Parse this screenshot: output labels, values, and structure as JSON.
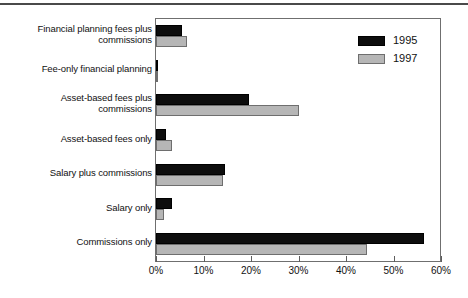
{
  "chart_data": {
    "type": "bar",
    "orientation": "horizontal",
    "title": "",
    "xlabel": "",
    "ylabel": "",
    "xlim": [
      0,
      60
    ],
    "grid": false,
    "legend_position": "top-right",
    "xtick_labels": [
      "0%",
      "10%",
      "20%",
      "30%",
      "40%",
      "50%",
      "60%"
    ],
    "xtick_values": [
      0,
      10,
      20,
      30,
      40,
      50,
      60
    ],
    "categories": [
      "Financial planning fees plus commissions",
      "Fee-only financial planning",
      "Asset-based fees plus commissions",
      "Asset-based fees only",
      "Salary plus commissions",
      "Salary only",
      "Commissions only"
    ],
    "category_lines": [
      [
        "Financial planning fees plus",
        "commissions"
      ],
      [
        "Fee-only financial planning"
      ],
      [
        "Asset-based fees plus",
        "commissions"
      ],
      [
        "Asset-based fees only"
      ],
      [
        "Salary plus commissions"
      ],
      [
        "Salary only"
      ],
      [
        "Commissions only"
      ]
    ],
    "series": [
      {
        "name": "1995",
        "color": "#0d0d0d",
        "values": [
          5.5,
          0.4,
          19.5,
          2.2,
          14.5,
          3.3,
          56.5
        ]
      },
      {
        "name": "1997",
        "color": "#b6b6b6",
        "values": [
          6.5,
          0.5,
          30.0,
          3.3,
          14.2,
          1.6,
          44.5
        ]
      }
    ]
  },
  "legend": {
    "items": [
      {
        "label": "1995",
        "color": "#0d0d0d"
      },
      {
        "label": "1997",
        "color": "#b6b6b6"
      }
    ]
  }
}
